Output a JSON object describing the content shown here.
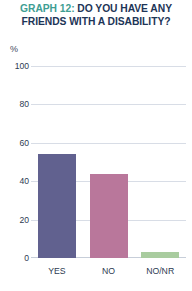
{
  "card": {
    "background": "#ffffff"
  },
  "title": {
    "graph_number": "GRAPH 12:",
    "line1_rest": " DO YOU HAVE ANY",
    "line2": "FRIENDS WITH A DISABILITY?",
    "graph_number_color": "#3f9e93",
    "text_color": "#1d3557"
  },
  "chart_data": {
    "type": "bar",
    "title": "GRAPH 12: DO YOU HAVE ANY FRIENDS WITH A DISABILITY?",
    "categories": [
      "YES",
      "NO",
      "NO/NR"
    ],
    "values": [
      54,
      44,
      3
    ],
    "series": [
      {
        "name": "Responses",
        "values": [
          54,
          44,
          3
        ]
      }
    ],
    "bar_colors": [
      "#61618f",
      "#b9779b",
      "#a9cc9f"
    ],
    "xlabel": "",
    "ylabel": "%",
    "ylim": [
      0,
      100
    ],
    "yticks": [
      0,
      20,
      40,
      60,
      80,
      100
    ],
    "ytick_labels": [
      "0",
      "20",
      "40",
      "60",
      "80",
      "100"
    ],
    "grid": true,
    "legend": "none",
    "gridline_color": "#d8dde6"
  },
  "axis": {
    "percent_symbol": "%"
  }
}
